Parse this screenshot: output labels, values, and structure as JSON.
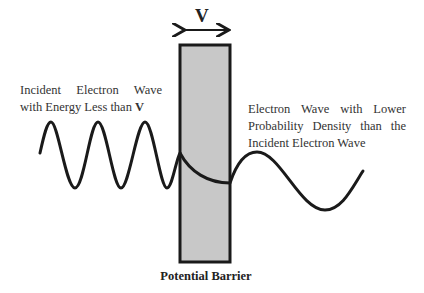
{
  "diagram": {
    "title_symbol": "V",
    "left_label": {
      "line1": "Incident Electron Wave",
      "line2_prefix": "with Energy Less than ",
      "line2_symbol": "V"
    },
    "right_label": {
      "line1": "Electron Wave with Lower",
      "line2": "Probability Density than the",
      "line3": "Incident Electron Wave"
    },
    "barrier_label": "Potential Barrier",
    "colors": {
      "barrier_fill": "#c8c8c8",
      "stroke": "#1a1a1a",
      "background": "#ffffff"
    }
  }
}
